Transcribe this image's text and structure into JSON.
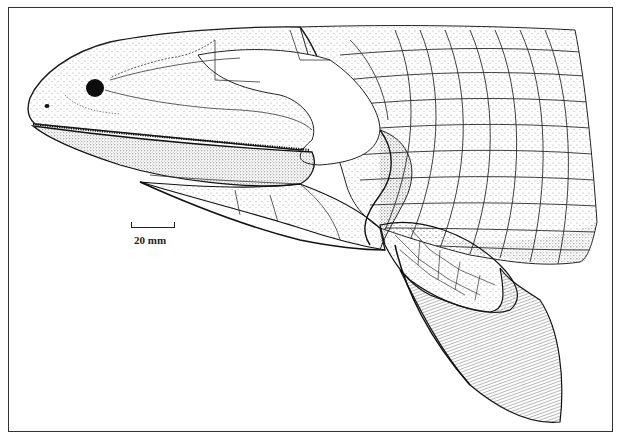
{
  "figure": {
    "scale_bar": {
      "label": "20 mm"
    },
    "colors": {
      "ink": "#1a1a1a",
      "paper": "#ffffff",
      "frame": "#333333"
    }
  }
}
